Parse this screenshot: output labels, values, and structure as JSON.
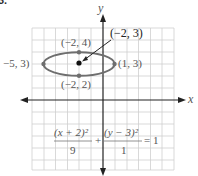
{
  "problem_number": "3.",
  "axes": {
    "x_label": "x",
    "y_label": "y"
  },
  "grid": {
    "min": -6,
    "max": 6,
    "cell_px": 11.8
  },
  "ellipse": {
    "center": [
      -2,
      3
    ],
    "a": 3,
    "b": 1,
    "color": "#6e6e6e"
  },
  "points": [
    {
      "label": "(−2, 4)",
      "coords": [
        -2,
        4
      ]
    },
    {
      "label": "−5, 3)",
      "coords": [
        -5,
        3
      ]
    },
    {
      "label": "(1, 3)",
      "coords": [
        1,
        3
      ]
    },
    {
      "label": "(−2, 2)",
      "coords": [
        -2,
        2
      ]
    },
    {
      "label": "(−2, 3)",
      "coords": [
        -2,
        3
      ]
    }
  ],
  "equation": {
    "term1_num": "(x + 2)²",
    "term1_den": "9",
    "plus": "+",
    "term2_num": "(y − 3)²",
    "term2_den": "1",
    "rhs": "= 1"
  }
}
